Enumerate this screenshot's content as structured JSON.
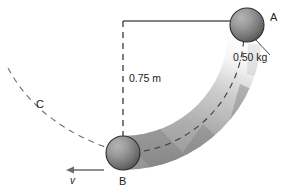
{
  "figure": {
    "type": "physics-diagram",
    "background_color": "#ffffff",
    "width": 300,
    "height": 195
  },
  "labels": {
    "point_a": "A",
    "point_b": "B",
    "point_c": "C",
    "velocity": "v",
    "mass": "0.50 kg",
    "height": "0.75 m"
  },
  "objects": {
    "ball_a": {
      "name": "ball-a",
      "cx": 247,
      "cy": 25,
      "r": 17,
      "fill_light": "#9d9d9d",
      "fill_dark": "#5e5e5e",
      "stroke": "#2f2f2f"
    },
    "ball_b": {
      "name": "ball-b",
      "cx": 123,
      "cy": 153,
      "r": 17,
      "fill_light": "#9d9d9d",
      "fill_dark": "#5e5e5e",
      "stroke": "#2f2f2f"
    },
    "ramp": {
      "name": "curved-ramp",
      "band_color": "#a8a8a8",
      "segment_color": "#8d8d8d",
      "fade_color": "#ffffff"
    },
    "height_line": {
      "name": "height-dashed-line",
      "x": 123,
      "y_top": 21,
      "y_bottom": 136,
      "color": "#3a3a3a",
      "style": "dashed"
    },
    "top_line": {
      "name": "horizontal-reference-line",
      "x_start": 123,
      "x_end": 247,
      "y": 21,
      "color": "#5a5a5a",
      "style": "solid"
    },
    "trajectory_arc": {
      "name": "trajectory-dashed-arc",
      "color": "#6a6a6a",
      "style": "dashed"
    },
    "ramp_centerline": {
      "name": "ramp-centerline-dashed",
      "color": "#3a3a3a",
      "style": "dashed"
    },
    "velocity_arrow": {
      "name": "velocity-arrow",
      "direction": "left",
      "x_tail": 104,
      "x_head": 68,
      "y": 170,
      "color": "#6a6a6a"
    },
    "mass_leader": {
      "name": "mass-leader-line",
      "color": "#4a4a4a"
    }
  }
}
